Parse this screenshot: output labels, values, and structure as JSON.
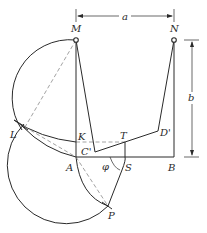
{
  "diagram": {
    "type": "four-bar linkage graphical synthesis",
    "points": {
      "M": "M",
      "N": "N",
      "K": "K",
      "C_prime": "C'",
      "T": "T",
      "D_prime": "D'",
      "A": "A",
      "B": "B",
      "S": "S",
      "P": "P",
      "L": "L"
    },
    "angle_label": "φ",
    "dimensions": {
      "horizontal": "a",
      "vertical": "b"
    },
    "colors": {
      "line": "#2a2a2a",
      "dashed": "#8a8a8a",
      "background": "#ffffff"
    }
  }
}
